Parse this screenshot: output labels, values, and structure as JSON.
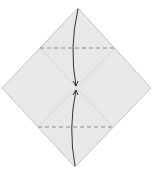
{
  "diagram": {
    "type": "origami-step",
    "paper": {
      "shape": "diamond",
      "vertices": {
        "top": [
          78,
          8
        ],
        "right": [
          151,
          88
        ],
        "bottom": [
          75,
          167
        ],
        "left": [
          2,
          88
        ]
      },
      "fill": "#e8e8e8",
      "edge": "#c4c4c4"
    },
    "creases": {
      "color": "#d2d2d2",
      "lines": [
        {
          "from": [
            40,
            48
          ],
          "to": [
            113,
            127
          ]
        },
        {
          "from": [
            115,
            48
          ],
          "to": [
            38,
            127
          ]
        }
      ]
    },
    "valley_folds": {
      "color": "#8a8a8a",
      "lines": [
        {
          "name": "upper-valley-fold",
          "from": [
            40,
            48
          ],
          "to": [
            116,
            48
          ]
        },
        {
          "name": "lower-valley-fold",
          "from": [
            38,
            127
          ],
          "to": [
            115,
            127
          ]
        }
      ]
    },
    "arrows": {
      "color": "#333333",
      "items": [
        {
          "name": "top-fold-arrow",
          "from": [
            78,
            9
          ],
          "to": [
            76,
            86
          ]
        },
        {
          "name": "bottom-fold-arrow",
          "from": [
            75,
            166
          ],
          "to": [
            76,
            90
          ]
        }
      ]
    }
  }
}
